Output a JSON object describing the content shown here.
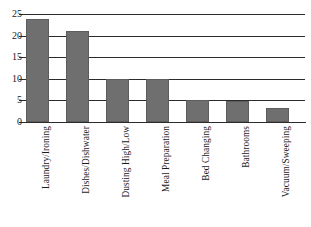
{
  "chart_data": {
    "type": "bar",
    "title": "",
    "xlabel": "",
    "ylabel": "",
    "ylim": [
      0,
      25
    ],
    "yticks": [
      0,
      5,
      10,
      15,
      20,
      25
    ],
    "grid": "horizontal",
    "legend": "none",
    "orientation": "vertical",
    "bar_color": "#6f6f6f",
    "axis_color": "#2b2b2b",
    "background": "#ffffff",
    "xtick_rotation": -90,
    "categories": [
      "Laundry/Ironing",
      "Dishes/Dishwater",
      "Dusting High/Low",
      "Meal Preparation",
      "Bed Changing",
      "Bathrooms",
      "Vacuum/Sweeping"
    ],
    "values": [
      23.8,
      21.0,
      10.0,
      10.0,
      5.0,
      4.8,
      3.3
    ]
  }
}
